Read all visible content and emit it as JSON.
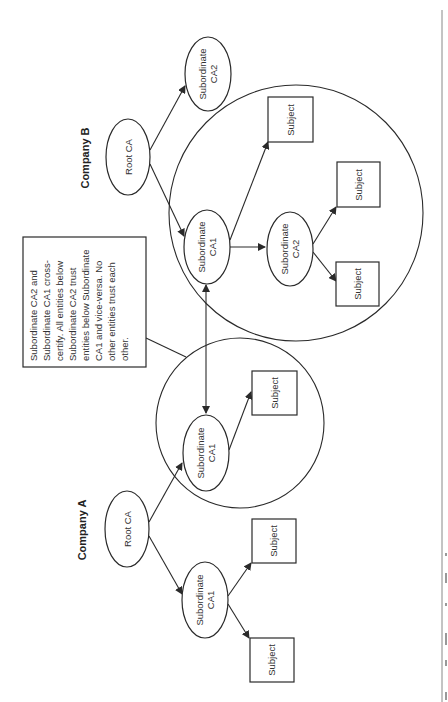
{
  "diagram": {
    "orientation": "rotated-90-ccw",
    "companies": [
      {
        "label": "Company B",
        "root": "Root CA",
        "subordinate_ca2_outside": "Subordinate CA2",
        "domain_nodes": {
          "sub_ca1": "Subordinate CA1",
          "sub_ca2": "Subordinate CA2",
          "subjects": [
            "Subject",
            "Subject",
            "Subject"
          ]
        }
      },
      {
        "label": "Company A",
        "root": "Root CA",
        "domain_nodes": {
          "sub_ca1": "Subordinate CA1",
          "subjects": [
            "Subject"
          ]
        },
        "subordinate_ca1_outside": "Subordinate CA1",
        "outside_subjects": [
          "Subject",
          "Subject"
        ]
      }
    ],
    "node_label_lines": {
      "root": [
        "Root CA"
      ],
      "subordinate_ca1": [
        "Subordinate",
        "CA1"
      ],
      "subordinate_ca2": [
        "Subordinate",
        "CA2"
      ],
      "subject": [
        "Subject"
      ]
    },
    "note": {
      "text": "Subordinate CA2 and Subordinate CA1 cross-certify. All entities below Subordinate CA2 trust entities below Subordinate CA1 and vice-versa. No other entities trust each other.",
      "lines": [
        "Subordinate CA2 and",
        "Subordinate CA1 cross-",
        "certify. All entities below",
        "Subordinate CA2 trust",
        "entities below Subordinate",
        "CA1 and vice-versa. No",
        "other entities trust each",
        "other."
      ]
    },
    "cross_certification": "bidirectional arrow between Company B Subordinate CA1 and Company A Subordinate CA1"
  },
  "colors": {
    "stroke": "#2a2a2a",
    "background": "#ffffff",
    "text": "#333333"
  }
}
